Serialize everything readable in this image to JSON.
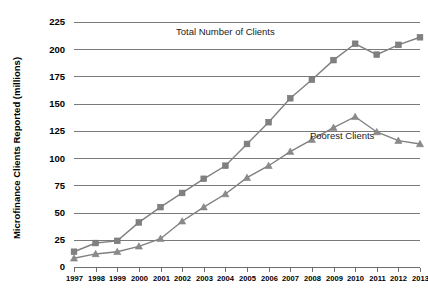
{
  "chart_data": {
    "type": "line",
    "title": "",
    "xlabel": "",
    "ylabel": "Microfinance Clients Reported (millions)",
    "x": [
      1997,
      1998,
      1999,
      2000,
      2001,
      2002,
      2003,
      2004,
      2005,
      2006,
      2007,
      2008,
      2009,
      2010,
      2011,
      2012,
      2013
    ],
    "categories": [
      "1997",
      "1998",
      "1999",
      "2000",
      "2001",
      "2002",
      "2003",
      "2004",
      "2005",
      "2006",
      "2007",
      "2008",
      "2009",
      "2010",
      "2011",
      "2012",
      "2013"
    ],
    "series": [
      {
        "name": "Total Number of Clients",
        "marker": "square",
        "color": "#808080",
        "values": [
          14,
          22,
          24,
          41,
          55,
          68,
          81,
          93,
          113,
          133,
          155,
          172,
          190,
          205,
          195,
          204,
          211
        ]
      },
      {
        "name": "Poorest Clients",
        "marker": "triangle",
        "color": "#8a8a8a",
        "values": [
          8,
          12,
          14,
          19,
          26,
          42,
          55,
          67,
          82,
          93,
          106,
          117,
          128,
          138,
          124,
          116,
          113
        ]
      }
    ],
    "ylim": [
      0,
      225
    ],
    "yticks": [
      0,
      25,
      50,
      75,
      100,
      125,
      150,
      175,
      200,
      225
    ],
    "xlim": [
      1997,
      2013
    ],
    "grid": true,
    "legend_position": "inline-annotations",
    "annotations": [
      {
        "text": "Total Number of Clients",
        "x": 2004,
        "y": 213
      },
      {
        "text": "Poorest Clients",
        "x": 2009.4,
        "y": 118
      }
    ]
  },
  "axis": {
    "y_title": "Microfinance Clients Reported (millions)",
    "y_ticks": [
      "225",
      "200",
      "175",
      "150",
      "125",
      "100",
      "75",
      "50",
      "25",
      "0"
    ],
    "x_ticks": [
      "1997",
      "1998",
      "1999",
      "2000",
      "2001",
      "2002",
      "2003",
      "2004",
      "2005",
      "2006",
      "2007",
      "2008",
      "2009",
      "2010",
      "2011",
      "2012",
      "2013"
    ]
  },
  "labels": {
    "total_clients": "Total Number of Clients",
    "poorest_clients": "Poorest Clients"
  }
}
